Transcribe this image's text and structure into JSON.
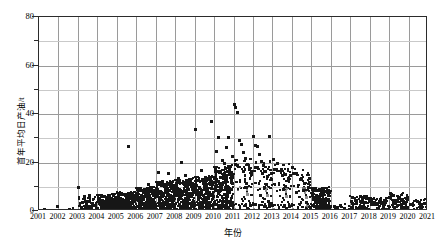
{
  "chart_data": {
    "type": "scatter",
    "title": "",
    "xlabel": "年份",
    "ylabel": "首年平均日产油/t",
    "xlim": [
      2001,
      2021
    ],
    "ylim": [
      0,
      80
    ],
    "grid": true,
    "legend": null,
    "x_tick_labels": [
      "2001",
      "2002",
      "2003",
      "2004",
      "2005",
      "2006",
      "2007",
      "2008",
      "2009",
      "2010",
      "2011",
      "2012",
      "2013",
      "2014",
      "2015",
      "2016",
      "2017",
      "2018",
      "2019",
      "2020",
      "2021"
    ],
    "y_tick_labels": [
      "0",
      "20",
      "40",
      "60",
      "80"
    ],
    "y_minor_ticks": [
      10,
      30,
      50,
      70
    ],
    "marker": "square",
    "marker_color": "#161616",
    "series": [
      {
        "name": "首年平均日产油",
        "points": [
          [
            2001.3,
            0.6
          ],
          [
            2001.95,
            1.9
          ],
          [
            2002.55,
            0.5
          ],
          [
            2002.8,
            0.4
          ],
          [
            2003.05,
            9.5
          ],
          [
            2003.2,
            1.2
          ],
          [
            2003.45,
            0.8
          ],
          [
            2003.6,
            5.5
          ],
          [
            2003.62,
            6.4
          ],
          [
            2003.75,
            3.2
          ],
          [
            2003.85,
            2.1
          ],
          [
            2003.95,
            1.1
          ],
          [
            2004.05,
            4.0
          ],
          [
            2004.15,
            2.6
          ],
          [
            2004.25,
            1.4
          ],
          [
            2004.4,
            3.0
          ],
          [
            2004.55,
            2.2
          ],
          [
            2004.7,
            1.6
          ],
          [
            2004.85,
            3.6
          ],
          [
            2004.95,
            0.9
          ],
          [
            2005.05,
            2.8
          ],
          [
            2005.2,
            5.0
          ],
          [
            2005.35,
            1.8
          ],
          [
            2005.5,
            3.3
          ],
          [
            2005.6,
            26.6
          ],
          [
            2005.7,
            2.4
          ],
          [
            2005.85,
            4.4
          ],
          [
            2005.95,
            1.3
          ],
          [
            2006.05,
            6.0
          ],
          [
            2006.2,
            3.1
          ],
          [
            2006.35,
            7.8
          ],
          [
            2006.5,
            2.0
          ],
          [
            2006.65,
            11.0
          ],
          [
            2006.75,
            4.6
          ],
          [
            2006.85,
            3.4
          ],
          [
            2006.95,
            1.7
          ],
          [
            2007.05,
            8.6
          ],
          [
            2007.15,
            16.0
          ],
          [
            2007.25,
            5.2
          ],
          [
            2007.35,
            12.0
          ],
          [
            2007.45,
            3.7
          ],
          [
            2007.55,
            9.2
          ],
          [
            2007.65,
            15.4
          ],
          [
            2007.75,
            6.5
          ],
          [
            2007.85,
            4.2
          ],
          [
            2007.95,
            2.5
          ],
          [
            2008.05,
            10.4
          ],
          [
            2008.15,
            13.2
          ],
          [
            2008.25,
            6.8
          ],
          [
            2008.35,
            20.2
          ],
          [
            2008.45,
            8.0
          ],
          [
            2008.55,
            14.6
          ],
          [
            2008.65,
            5.4
          ],
          [
            2008.75,
            11.6
          ],
          [
            2008.85,
            7.2
          ],
          [
            2008.95,
            3.9
          ],
          [
            2009.05,
            33.8
          ],
          [
            2009.15,
            12.6
          ],
          [
            2009.25,
            9.8
          ],
          [
            2009.35,
            16.8
          ],
          [
            2009.45,
            6.2
          ],
          [
            2009.55,
            13.8
          ],
          [
            2009.65,
            8.4
          ],
          [
            2009.75,
            11.2
          ],
          [
            2009.85,
            37.0
          ],
          [
            2009.95,
            5.8
          ],
          [
            2010.05,
            17.6
          ],
          [
            2010.15,
            24.4
          ],
          [
            2010.25,
            30.4
          ],
          [
            2010.35,
            14.0
          ],
          [
            2010.45,
            21.0
          ],
          [
            2010.55,
            19.4
          ],
          [
            2010.65,
            26.0
          ],
          [
            2010.75,
            30.2
          ],
          [
            2010.85,
            18.2
          ],
          [
            2010.95,
            22.6
          ],
          [
            2011.05,
            43.8
          ],
          [
            2011.1,
            42.8
          ],
          [
            2011.2,
            40.6
          ],
          [
            2011.3,
            29.0
          ],
          [
            2011.4,
            27.4
          ],
          [
            2011.5,
            24.0
          ],
          [
            2011.6,
            21.8
          ],
          [
            2011.7,
            19.0
          ],
          [
            2011.8,
            17.2
          ],
          [
            2011.9,
            15.0
          ],
          [
            2012.05,
            30.8
          ],
          [
            2012.15,
            27.0
          ],
          [
            2012.25,
            26.4
          ],
          [
            2012.35,
            23.2
          ],
          [
            2012.45,
            20.6
          ],
          [
            2012.55,
            18.8
          ],
          [
            2012.65,
            16.4
          ],
          [
            2012.75,
            14.2
          ],
          [
            2012.85,
            30.6
          ],
          [
            2012.95,
            12.8
          ],
          [
            2013.05,
            21.4
          ],
          [
            2013.25,
            19.6
          ],
          [
            2013.45,
            17.0
          ],
          [
            2013.65,
            15.2
          ],
          [
            2013.85,
            13.4
          ],
          [
            2014.05,
            17.8
          ],
          [
            2014.25,
            15.6
          ],
          [
            2014.45,
            13.0
          ],
          [
            2014.65,
            11.4
          ],
          [
            2014.85,
            9.6
          ],
          [
            2015.05,
            9.0
          ],
          [
            2015.25,
            6.6
          ],
          [
            2015.45,
            4.8
          ],
          [
            2015.65,
            3.0
          ],
          [
            2015.85,
            1.5
          ],
          [
            2016.2,
            2.0
          ],
          [
            2016.7,
            1.2
          ],
          [
            2017.1,
            5.6
          ],
          [
            2017.3,
            4.2
          ],
          [
            2017.55,
            6.0
          ],
          [
            2017.8,
            3.4
          ],
          [
            2018.1,
            4.8
          ],
          [
            2018.4,
            2.8
          ],
          [
            2018.7,
            3.6
          ],
          [
            2019.05,
            7.2
          ],
          [
            2019.25,
            6.4
          ],
          [
            2019.5,
            5.0
          ],
          [
            2019.75,
            3.8
          ],
          [
            2020.1,
            2.6
          ],
          [
            2020.45,
            4.0
          ],
          [
            2020.8,
            3.2
          ],
          [
            2021.0,
            5.4
          ]
        ]
      }
    ]
  },
  "axes": {
    "x_title": "年份",
    "y_title": "首年平均日产油/t"
  }
}
